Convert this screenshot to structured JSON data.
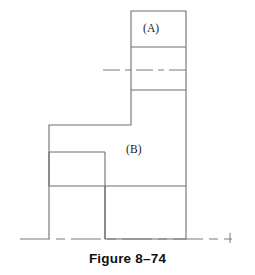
{
  "figure": {
    "caption": "Figure 8–74",
    "background_color": "#ffffff",
    "line_color": "#6e6e6e",
    "centerline_color": "#7a7a7a",
    "text_color": "#1b1b1b",
    "width": 255,
    "height": 275
  },
  "labels": {
    "region_a": "(A)",
    "region_b": "(B)"
  },
  "geometry": {
    "description": "Stepped sectional profile of a machine part",
    "units": "pixels",
    "outline_points": [
      [
        131,
        11
      ],
      [
        186,
        11
      ],
      [
        186,
        239
      ],
      [
        105,
        239
      ],
      [
        105,
        186
      ],
      [
        49,
        186
      ],
      [
        49,
        125
      ],
      [
        131,
        125
      ]
    ],
    "bottom_open_verticals": [
      {
        "x": 49,
        "y_from": 152,
        "y_to": 239
      },
      {
        "x": 105,
        "y_from": 152,
        "y_to": 239
      }
    ],
    "internal_division_lines": [
      {
        "name": "band-top-divider",
        "x1": 131,
        "y1": 47,
        "x2": 186,
        "y2": 47
      },
      {
        "name": "band-bottom-divider",
        "x1": 131,
        "y1": 90,
        "x2": 186,
        "y2": 90
      },
      {
        "name": "left-step-shoulder",
        "x1": 49,
        "y1": 152,
        "x2": 105,
        "y2": 152
      },
      {
        "name": "lower-shoulder",
        "x1": 105,
        "y1": 186,
        "x2": 186,
        "y2": 186
      }
    ],
    "centerlines": [
      {
        "name": "horizontal-axis-centerline",
        "orientation": "horizontal",
        "x1": 103,
        "y1": 70,
        "x2": 188,
        "y2": 70
      },
      {
        "name": "bottom-base-centerline",
        "orientation": "horizontal",
        "x1": 20,
        "y1": 239,
        "x2": 232,
        "y2": 239
      }
    ],
    "end_tick": {
      "x": 230,
      "y_from": 233,
      "y_to": 243
    }
  }
}
